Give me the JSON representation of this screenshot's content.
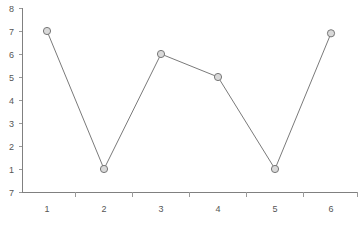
{
  "chart_data": {
    "type": "line",
    "title": "",
    "xlabel": "",
    "ylabel": "",
    "categories": [
      "1",
      "2",
      "3",
      "4",
      "5",
      "6"
    ],
    "values": [
      7,
      1,
      6,
      5,
      1,
      6.9
    ],
    "series": [
      {
        "name": "series-1",
        "values": [
          7,
          1,
          6,
          5,
          1,
          6.9
        ]
      }
    ],
    "x_tick_labels": [
      "1",
      "2",
      "3",
      "4",
      "5",
      "6"
    ],
    "y_tick_labels": [
      "8",
      "7",
      "6",
      "5",
      "4",
      "3",
      "2",
      "1",
      "7"
    ],
    "y_tick_values": [
      8,
      7,
      6,
      5,
      4,
      3,
      2,
      1,
      0
    ],
    "ylim": [
      0,
      8
    ],
    "grid": false,
    "legend": false,
    "legend_position": "none",
    "marker": "circle",
    "colors": {
      "line": "#7a7a7a",
      "marker_fill": "#d9d9d9",
      "marker_stroke": "#777777",
      "axis": "#808080",
      "tick_text": "#555555",
      "background": "#ffffff"
    }
  }
}
